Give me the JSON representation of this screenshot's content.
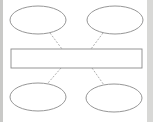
{
  "diagram": {
    "type": "blank-concept-map",
    "central_box": {
      "label": ""
    },
    "nodes": [
      {
        "id": "top-left",
        "label": ""
      },
      {
        "id": "top-right",
        "label": ""
      },
      {
        "id": "bottom-left",
        "label": ""
      },
      {
        "id": "bottom-right",
        "label": ""
      }
    ],
    "connector_style": "dashed",
    "colors": {
      "stroke": "#8a8a8a",
      "fill": "#ffffff",
      "background": "#ffffff"
    }
  }
}
